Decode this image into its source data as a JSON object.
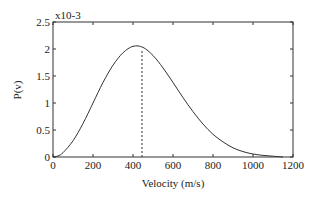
{
  "chart_data": {
    "type": "line",
    "title": "",
    "xlabel": "Velocity (m/s)",
    "ylabel": "P(v)",
    "y_scale_label": "x10-3",
    "xlim": [
      0,
      1200
    ],
    "ylim": [
      0,
      2.5
    ],
    "x_ticks": [
      0,
      200,
      400,
      600,
      800,
      1000,
      1200
    ],
    "y_ticks": [
      0,
      0.5,
      1,
      1.5,
      2,
      2.5
    ],
    "y_tick_labels": [
      "0",
      "0.5",
      "1",
      "1.5",
      "2",
      "2.5"
    ],
    "grid": false,
    "legend": null,
    "series": [
      {
        "name": "Maxwell speed distribution",
        "style": "solid",
        "x": [
          0,
          25,
          50,
          100,
          150,
          200,
          250,
          300,
          350,
          400,
          450,
          500,
          550,
          600,
          650,
          700,
          750,
          800,
          850,
          900,
          950,
          1000,
          1050,
          1100,
          1150
        ],
        "y": [
          0,
          0.02,
          0.08,
          0.3,
          0.62,
          1.0,
          1.38,
          1.7,
          1.93,
          2.05,
          2.03,
          1.88,
          1.65,
          1.38,
          1.1,
          0.84,
          0.61,
          0.42,
          0.28,
          0.17,
          0.1,
          0.055,
          0.03,
          0.015,
          0.0
        ]
      }
    ],
    "annotations": [
      {
        "type": "vertical-dashed-line",
        "x": 445,
        "y_top": 2.0,
        "description": "mean speed marker"
      }
    ]
  }
}
